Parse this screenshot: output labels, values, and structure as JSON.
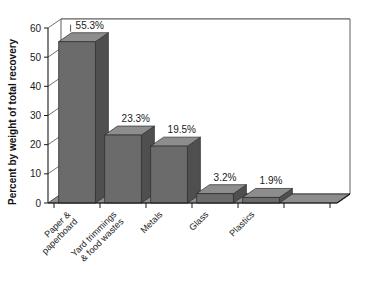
{
  "chart_data": {
    "type": "bar",
    "title": "",
    "subtitle": "",
    "xlabel": "",
    "ylabel": "Percent by weight of total recovery",
    "ylim": [
      0,
      60
    ],
    "ytick_step": 10,
    "ytick_labels": [
      "0",
      "10",
      "20",
      "30",
      "40",
      "50",
      "60"
    ],
    "grid": true,
    "legend": false,
    "legend_position": "none",
    "three_d": true,
    "categories": [
      "Paper & paperboard",
      "Yard trimmings & food wastes",
      "Metals",
      "Glass",
      "Plastics"
    ],
    "category_lines": [
      [
        "Paper &",
        "paperboard"
      ],
      [
        "Yard trimmings",
        "& food wastes"
      ],
      [
        "Metals"
      ],
      [
        "Glass"
      ],
      [
        "Plastics"
      ]
    ],
    "values": [
      55.3,
      23.3,
      19.5,
      3.2,
      1.9
    ],
    "data_labels": [
      "55.3%",
      "23.3%",
      "19.5%",
      "3.2%",
      "1.9%"
    ],
    "colors": {
      "bar_front": "#6b6b6b",
      "bar_top": "#8d8d8d",
      "bar_side": "#4f4f4f",
      "floor": "#8d8d8d",
      "gridline": "#4d4d4d",
      "axis": "#1a1a1a",
      "text": "#1a1a1a",
      "background": "#ffffff"
    }
  },
  "axis": {
    "y_title": "Percent by weight of total recovery"
  }
}
